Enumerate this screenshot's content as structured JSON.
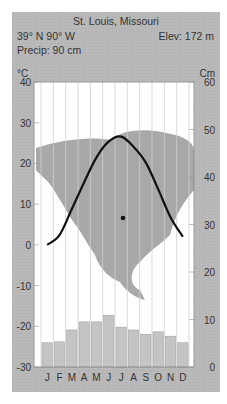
{
  "header": {
    "title": "St. Louis, Missouri",
    "coordinates": "39° N 90° W",
    "elevation": "Elev: 172 m",
    "precipitation": "Precip: 90 cm",
    "left_unit": "°C",
    "right_unit": "Cm"
  },
  "colors": {
    "panel": "#b9b9b9",
    "plot_bg": "#ffffff",
    "map": "#a8a8a8",
    "bars": "#c4c4c4",
    "curve": "#111111"
  },
  "chart_data": {
    "type": "climograph",
    "title": "St. Louis, Missouri",
    "categories": [
      "J",
      "F",
      "M",
      "A",
      "M",
      "J",
      "J",
      "A",
      "S",
      "O",
      "N",
      "D"
    ],
    "series": [
      {
        "name": "Temperature (°C)",
        "type": "line",
        "axis": "left",
        "values": [
          0,
          2.4,
          8.8,
          15.4,
          21.5,
          25.4,
          26.6,
          24.1,
          20.2,
          13.7,
          6.8,
          2.0
        ]
      },
      {
        "name": "Precipitation (cm)",
        "type": "bar",
        "axis": "right",
        "values": [
          5.1,
          5.3,
          7.8,
          9.5,
          9.5,
          10.9,
          8.4,
          7.8,
          6.9,
          7.4,
          6.5,
          5.1
        ]
      }
    ],
    "left_axis": {
      "label": "°C",
      "ticks": [
        40,
        30,
        20,
        10,
        0,
        -10,
        -20,
        -30
      ],
      "range": [
        -30,
        40
      ]
    },
    "right_axis": {
      "label": "Cm",
      "ticks": [
        60,
        50,
        40,
        30,
        20,
        10,
        0
      ],
      "range": [
        0,
        60
      ]
    },
    "location_marker": {
      "label": "St. Louis",
      "description": "dot on North America map"
    },
    "grid": "vertical month lines",
    "background": "map of North America"
  }
}
